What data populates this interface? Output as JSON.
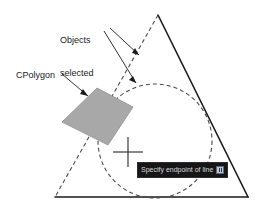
{
  "scene": {
    "title": "CPolygon selection illustration",
    "background_color": "#ffffff"
  },
  "annotations": {
    "objects_selected": {
      "line1": "Objects",
      "line2": "selected"
    },
    "cpolygon": {
      "label": "CPolygon"
    }
  },
  "tooltip": {
    "text": "Specify endpoint of line or",
    "icon": "dropdown-options-icon",
    "background_color": "#161616",
    "text_color": "#d8d8d8"
  },
  "geometry": {
    "solid_triangle": {
      "name": "triangle-object",
      "apex": [
        158,
        15
      ],
      "bottom_left": [
        55,
        197
      ],
      "bottom_right": [
        248,
        197
      ],
      "solid_edges": [
        "apex-bottom_right",
        "bottom_left-bottom_right"
      ],
      "dashed_edges": [
        "apex-bottom_left"
      ],
      "stroke_color": "#1a1a1a"
    },
    "circle": {
      "name": "circle-object",
      "center": [
        155,
        141
      ],
      "radius": 57,
      "style": "dashed",
      "stroke_color": "#4a4a4a"
    },
    "cpolygon_shape": {
      "name": "cpolygon-selection-area",
      "points": [
        [
          97,
          88
        ],
        [
          133,
          107
        ],
        [
          108,
          145
        ],
        [
          62,
          122
        ]
      ],
      "fill_color": "#a8a8a8",
      "stroke_color": "#8c8c8c"
    },
    "crosshair": {
      "name": "crosshair-cursor",
      "x": 128,
      "y": 152,
      "arm_length": 15,
      "color": "#3a3a3a"
    },
    "leaders": {
      "objects_selected_to_triangle": {
        "from": [
          110,
          30
        ],
        "to": [
          139,
          56
        ]
      },
      "objects_selected_to_circle": {
        "from": [
          104,
          32
        ],
        "to": [
          136,
          84
        ]
      },
      "cpolygon_to_shape": {
        "from": [
          62,
          74
        ],
        "to": [
          88,
          96
        ]
      }
    }
  }
}
